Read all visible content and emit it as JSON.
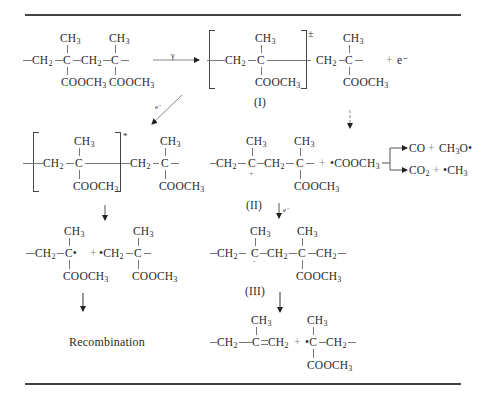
{
  "figure": {
    "labels": {
      "I": "(I)",
      "II": "(II)",
      "III": "(III)",
      "recombination": "Recombination"
    },
    "reagents": {
      "gamma": "γ",
      "electron": "e⁻",
      "electron_ann_1": "e⁻",
      "electron_ann_2": "e⁻",
      "plus": "+",
      "radical_cation": "±",
      "excited": "*"
    },
    "groups": {
      "ch3": "CH",
      "ch3_sub": "3",
      "ch2": "CH",
      "ch2_sub": "2",
      "c": "C",
      "cooch3": "COOCH",
      "cooch3_sub": "3",
      "cooch3_radical": "•COOCH",
      "c_radical": "C•",
      "ch2_radical": "•CH",
      "c_left_radical": "•C"
    },
    "products": {
      "co": "CO",
      "ch3o_radical": "CH",
      "ch3o_sub": "3",
      "ch3o_tail": "O•",
      "co2": "CO",
      "co2_sub": "2",
      "ch3_radical": "•CH",
      "ch3_radical_sub": "3"
    },
    "colors": {
      "ink": "#2a2a2a",
      "rule": "#444444",
      "bond": "#777777"
    }
  }
}
